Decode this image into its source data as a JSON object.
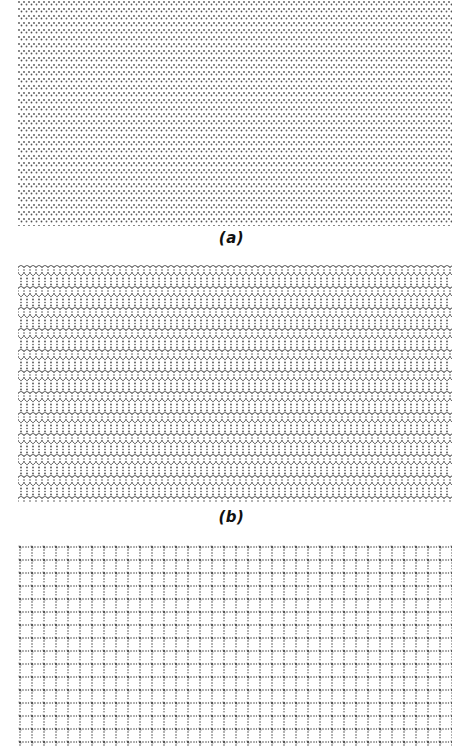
{
  "figure": {
    "panels": [
      {
        "id": "a",
        "label": "(a)",
        "pattern": "zigzag-dense-dots",
        "top": 0,
        "height": 226,
        "label_top": 229
      },
      {
        "id": "b",
        "label": "(b)",
        "pattern": "honeycomb-hexagonal",
        "top": 265,
        "height": 238,
        "label_top": 508
      },
      {
        "id": "c",
        "label": "",
        "pattern": "square-grid",
        "top": 545,
        "height": 201,
        "label_top": null
      }
    ],
    "colors": {
      "dots": "#2a2a2a",
      "background": "#ffffff"
    }
  }
}
